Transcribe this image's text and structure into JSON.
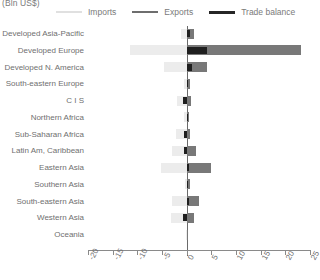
{
  "unit_label": "(Bln US$)",
  "colors": {
    "imports": "#ececec",
    "exports": "#787878",
    "balance": "#1f1f1f",
    "axis": "#8a8a8a",
    "text": "#6f6f6f"
  },
  "legend": [
    {
      "key": "imports",
      "label": "Imports"
    },
    {
      "key": "exports",
      "label": "Exports"
    },
    {
      "key": "balance",
      "label": "Trade balance"
    }
  ],
  "chart_data": {
    "type": "bar",
    "orientation": "horizontal",
    "title": "",
    "subtitle": "",
    "xlabel": "(Bln US$)",
    "ylabel": "",
    "xlim": [
      -20,
      25
    ],
    "xticks": [
      -20,
      -15,
      -10,
      -5,
      0,
      5,
      10,
      15,
      20,
      25
    ],
    "xticklabels": [
      "-20",
      "-15",
      "-10",
      "-5",
      "0",
      "5",
      "10",
      "15",
      "20",
      "25"
    ],
    "grid": false,
    "legend_position": "top",
    "categories": [
      "Developed Asia-Pacific",
      "Developed Europe",
      "Developed N. America",
      "South-eastern Europe",
      "C I S",
      "Northern Africa",
      "Sub-Saharan Africa",
      "Latin Am, Caribbean",
      "Eastern Asia",
      "Southern Asia",
      "South-eastern Asia",
      "Western Asia",
      "Oceania"
    ],
    "series": [
      {
        "name": "Imports",
        "values": [
          -1.2,
          -11.5,
          -4.5,
          -0.5,
          -2.0,
          -0.5,
          -2.2,
          -3.0,
          -5.2,
          -0.3,
          -3.0,
          -3.2,
          -0.1
        ]
      },
      {
        "name": "Exports",
        "values": [
          1.5,
          23.2,
          4.2,
          0.6,
          0.9,
          0.5,
          0.7,
          1.8,
          5.0,
          0.6,
          2.6,
          1.4,
          0.1
        ]
      },
      {
        "name": "Trade balance",
        "values": [
          0.6,
          4.2,
          1.0,
          0.3,
          -0.7,
          0.2,
          -0.6,
          -0.6,
          0.5,
          0.2,
          0.4,
          -0.8,
          0.0
        ]
      }
    ]
  }
}
